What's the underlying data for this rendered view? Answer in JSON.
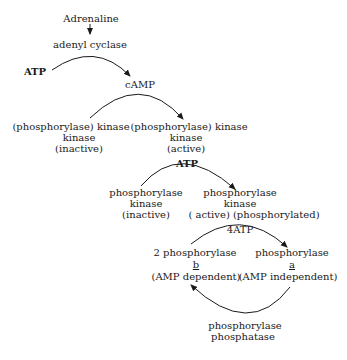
{
  "diagram": {
    "type": "biochemical cascade",
    "nodes": {
      "adrenaline": "Adrenaline",
      "adenyl_cyclase": "adenyl cyclase",
      "atp1": "ATP",
      "camp": "cAMP",
      "pkk_inactive": [
        "(phosphorylase) kinase",
        "kinase",
        "(inactive)"
      ],
      "pkk_active": [
        "(phosphorylase) kinase",
        "kinase",
        "(active)"
      ],
      "atp2": "ATP",
      "pk_inactive": [
        "phosphorylase",
        "kinase",
        "(inactive)"
      ],
      "pk_active": [
        "phosphorylase",
        "kinase",
        "( active) (phosphorylated)"
      ],
      "atp4": "4ATP",
      "phos_b": [
        "2 phosphorylase",
        "b",
        "(AMP  dependent)"
      ],
      "phos_a": [
        "phosphorylase",
        "a",
        "(AMP  independent)"
      ],
      "phosphatase": [
        "phosphorylase",
        "phosphatase"
      ]
    },
    "edges": [
      {
        "from": "Adrenaline",
        "to": "adenyl cyclase"
      },
      {
        "from": "ATP",
        "to": "cAMP",
        "catalyst": "adenyl cyclase"
      },
      {
        "from": "(phosphorylase) kinase kinase (inactive)",
        "to": "(phosphorylase) kinase kinase (active)",
        "effector": "cAMP"
      },
      {
        "from": "phosphorylase kinase (inactive)",
        "to": "phosphorylase kinase (active) (phosphorylated)",
        "cofactor": "ATP"
      },
      {
        "from": "2 phosphorylase b",
        "to": "phosphorylase a",
        "cofactor": "4ATP"
      },
      {
        "from": "phosphorylase a",
        "to": "2 phosphorylase b",
        "catalyst": "phosphorylase phosphatase"
      }
    ]
  }
}
